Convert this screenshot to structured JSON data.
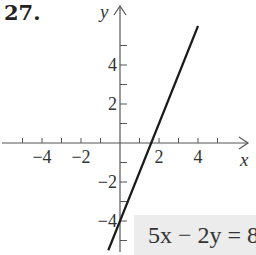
{
  "problem_number": "27.",
  "chart_data": {
    "type": "line",
    "title": "",
    "equation": "5x − 2y = 8",
    "xlabel": "x",
    "ylabel": "y",
    "x_tick_labels": [
      "−4",
      "−2",
      "2",
      "4"
    ],
    "y_tick_labels": [
      "4",
      "2",
      "−2",
      "−4"
    ],
    "x_ticks": [
      -5,
      -4,
      -3,
      -2,
      -1,
      1,
      2,
      3,
      4,
      5
    ],
    "y_ticks": [
      -5,
      -4,
      -3,
      -2,
      -1,
      1,
      2,
      3,
      4,
      5
    ],
    "xlim": [
      -6,
      6
    ],
    "ylim": [
      -5.5,
      6.5
    ],
    "grid": false,
    "series": [
      {
        "name": "5x - 2y = 8",
        "x": [
          -0.6,
          4.0
        ],
        "y": [
          -5.5,
          6.0
        ],
        "color": "#1a1a1a"
      }
    ],
    "intercepts": {
      "x_intercept": 1.6,
      "y_intercept": -4
    }
  },
  "colors": {
    "axis": "#555555",
    "line": "#1a1a1a",
    "equation_box": "#ececec"
  }
}
